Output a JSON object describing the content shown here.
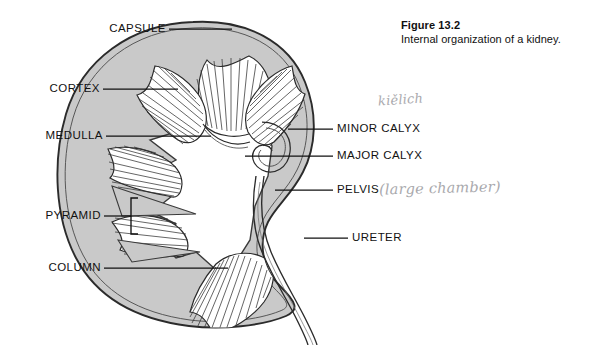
{
  "figure": {
    "number": "Figure 13.2",
    "caption": "Internal organization of a kidney."
  },
  "diagram": {
    "fill_color": "#c9c9c9",
    "outline_color": "#2b2b2b",
    "background_color": "#ffffff"
  },
  "labels": {
    "left": [
      {
        "id": "capsule",
        "text": "CAPSULE"
      },
      {
        "id": "cortex",
        "text": "CORTEX"
      },
      {
        "id": "medulla",
        "text": "MEDULLA"
      },
      {
        "id": "pyramid",
        "text": "PYRAMID"
      },
      {
        "id": "column",
        "text": "COLUMN"
      }
    ],
    "right": [
      {
        "id": "minor-calyx",
        "text": "MINOR CALYX"
      },
      {
        "id": "major-calyx",
        "text": "MAJOR CALYX"
      },
      {
        "id": "pelvis",
        "text": "PELVIS"
      },
      {
        "id": "ureter",
        "text": "URETER"
      }
    ]
  },
  "annotations": {
    "handwritten": [
      {
        "id": "kielich",
        "text": "kiělich",
        "near": "MINOR CALYX",
        "color": "#a9a9ad"
      },
      {
        "id": "large-chamber",
        "text": "(large chamber)",
        "near": "PELVIS",
        "color": "#a9a9ad"
      }
    ]
  }
}
